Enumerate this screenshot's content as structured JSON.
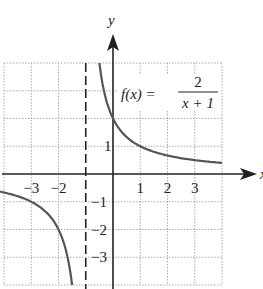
{
  "chart_data": {
    "type": "line",
    "title": "",
    "function_label": {
      "lhs": "f(x) =",
      "numerator": "2",
      "denominator": "x + 1"
    },
    "xlabel": "x",
    "ylabel": "y",
    "xlim": [
      -4,
      4
    ],
    "ylim": [
      -4,
      4
    ],
    "grid": true,
    "x_tick_labels": [
      "-3",
      "-2",
      "1",
      "2",
      "3"
    ],
    "y_tick_labels": [
      "1",
      "-1",
      "-2",
      "-3"
    ],
    "vertical_asymptote": {
      "x": -1,
      "style": "dashed"
    },
    "series": [
      {
        "name": "f(x) = 2/(x+1), right branch",
        "x": [
          -0.5,
          -0.25,
          0,
          0.5,
          1,
          2,
          3,
          4
        ],
        "y": [
          4,
          2.67,
          2,
          1.33,
          1,
          0.67,
          0.5,
          0.4
        ]
      },
      {
        "name": "f(x) = 2/(x+1), left branch",
        "x": [
          -4,
          -3,
          -2,
          -1.67,
          -1.5
        ],
        "y": [
          -0.67,
          -1,
          -2,
          -3,
          -4
        ]
      }
    ],
    "colors": {
      "curve": "#555555",
      "axis": "#222222",
      "grid": "#aaaaaa"
    }
  }
}
